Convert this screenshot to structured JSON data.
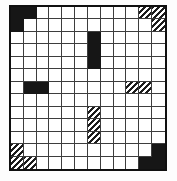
{
  "grid": {
    "rows": 13,
    "cols": 12,
    "colors": {
      "background": "#ffffff",
      "border": "#101010",
      "line": "#3d3d3d",
      "black_fill": "#161616",
      "hatch_ink": "#1c1c1c"
    },
    "black_cells": [
      [
        0,
        0
      ],
      [
        0,
        1
      ],
      [
        1,
        0
      ],
      [
        2,
        6
      ],
      [
        3,
        6
      ],
      [
        4,
        6
      ],
      [
        6,
        1
      ],
      [
        6,
        2
      ],
      [
        11,
        11
      ],
      [
        12,
        10
      ],
      [
        12,
        11
      ]
    ],
    "hatched_cells": [
      [
        0,
        10
      ],
      [
        0,
        11
      ],
      [
        1,
        11
      ],
      [
        6,
        9
      ],
      [
        6,
        10
      ],
      [
        8,
        6
      ],
      [
        9,
        6
      ],
      [
        10,
        6
      ],
      [
        11,
        0
      ],
      [
        12,
        0
      ],
      [
        12,
        1
      ]
    ]
  }
}
